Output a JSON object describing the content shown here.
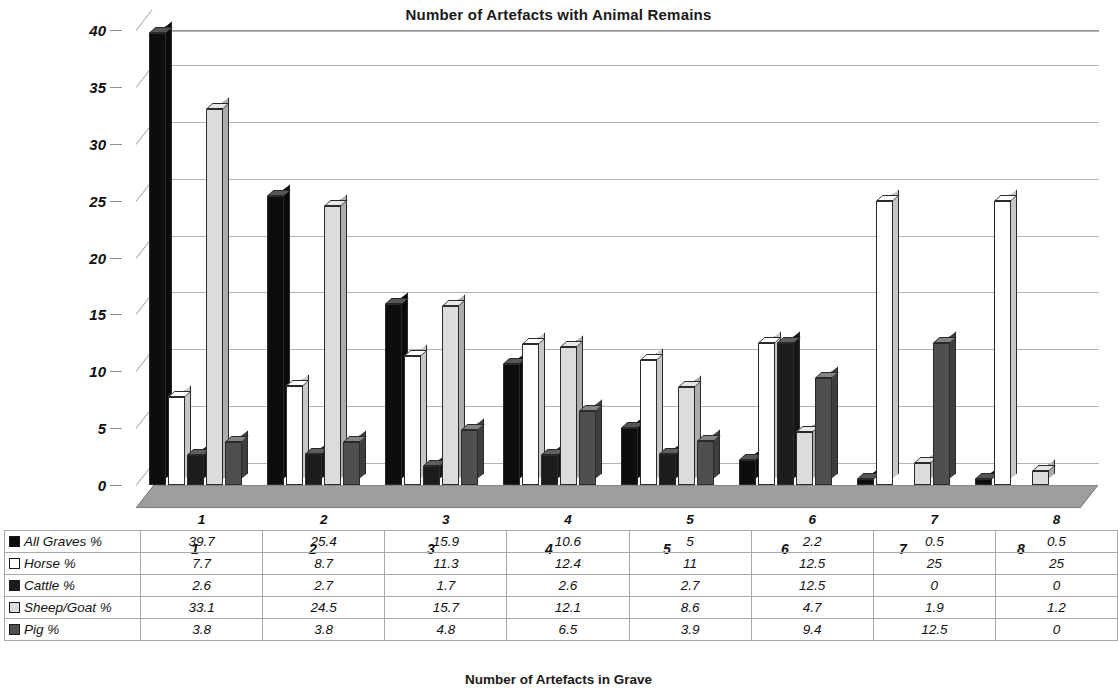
{
  "chart_data": {
    "type": "bar",
    "title": "Number of Artefacts with Animal Remains",
    "xlabel": "Number of Artefacts in Grave",
    "ylabel": "",
    "categories": [
      "1",
      "2",
      "3",
      "4",
      "5",
      "6",
      "7",
      "8"
    ],
    "ylim": [
      0,
      40
    ],
    "yticks": [
      0,
      5,
      10,
      15,
      20,
      25,
      30,
      35,
      40
    ],
    "grid": true,
    "legend_position": "data-table",
    "style": "3d-column",
    "series": [
      {
        "name": "All Graves %",
        "color": "#0d0d0d",
        "values": [
          39.7,
          25.4,
          15.9,
          10.6,
          5,
          2.2,
          0.5,
          0.5
        ]
      },
      {
        "name": "Horse %",
        "color": "#ffffff",
        "values": [
          7.7,
          8.7,
          11.3,
          12.4,
          11,
          12.5,
          25,
          25
        ]
      },
      {
        "name": "Cattle %",
        "color": "#1c1c1c",
        "values": [
          2.6,
          2.7,
          1.7,
          2.6,
          2.7,
          12.5,
          0,
          0
        ]
      },
      {
        "name": "Sheep/Goat %",
        "color": "#dcdcdc",
        "values": [
          33.1,
          24.5,
          15.7,
          12.1,
          8.6,
          4.7,
          1.9,
          1.2
        ]
      },
      {
        "name": "Pig %",
        "color": "#4f4f4f",
        "values": [
          3.8,
          3.8,
          4.8,
          6.5,
          3.9,
          9.4,
          12.5,
          0
        ]
      }
    ]
  },
  "table": {
    "corner_label": "",
    "column_headers": [
      "1",
      "2",
      "3",
      "4",
      "5",
      "6",
      "7",
      "8"
    ],
    "rows": [
      {
        "label": "All Graves %",
        "swatch": "#0d0d0d",
        "values": [
          "39.7",
          "25.4",
          "15.9",
          "10.6",
          "5",
          "2.2",
          "0.5",
          "0.5"
        ]
      },
      {
        "label": "Horse %",
        "swatch": "#ffffff",
        "values": [
          "7.7",
          "8.7",
          "11.3",
          "12.4",
          "11",
          "12.5",
          "25",
          "25"
        ]
      },
      {
        "label": "Cattle %",
        "swatch": "#1c1c1c",
        "values": [
          "2.6",
          "2.7",
          "1.7",
          "2.6",
          "2.7",
          "12.5",
          "0",
          "0"
        ]
      },
      {
        "label": "Sheep/Goat %",
        "swatch": "#dcdcdc",
        "values": [
          "33.1",
          "24.5",
          "15.7",
          "12.1",
          "8.6",
          "4.7",
          "1.9",
          "1.2"
        ]
      },
      {
        "label": "Pig %",
        "swatch": "#4f4f4f",
        "values": [
          "3.8",
          "3.8",
          "4.8",
          "6.5",
          "3.9",
          "9.4",
          "12.5",
          "0"
        ]
      }
    ]
  }
}
